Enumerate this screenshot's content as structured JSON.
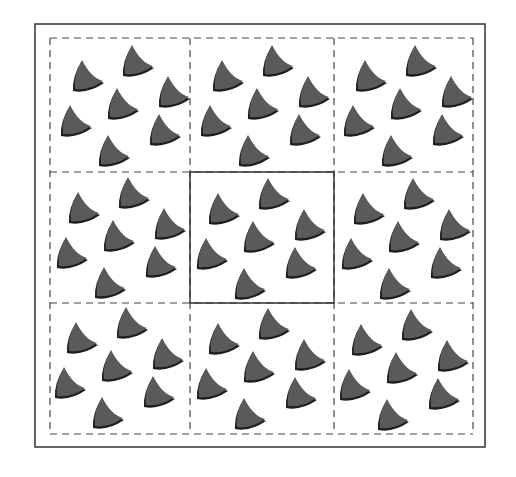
{
  "figure": {
    "colors": {
      "background": "#ffffff",
      "frame": "#333333",
      "dashed": "#444444",
      "motif_fill": "#5a5a5a",
      "motif_shadow": "#1e1e1e"
    },
    "outer_frame": {
      "x": 35,
      "y": 24,
      "w": 450,
      "h": 423
    },
    "grid": {
      "x_lines": [
        50,
        190,
        334,
        473
      ],
      "y_lines": [
        38,
        172,
        303,
        434
      ],
      "center_cell": {
        "row": 1,
        "col": 1,
        "style": "solid"
      },
      "other_cells_style": "dashed"
    },
    "motif": {
      "name": "shark-fin",
      "width": 34,
      "height": 32
    },
    "base_pattern": [
      {
        "x": 20,
        "y": 22
      },
      {
        "x": 70,
        "y": 7
      },
      {
        "x": 106,
        "y": 38
      },
      {
        "x": 55,
        "y": 50
      },
      {
        "x": 8,
        "y": 67
      },
      {
        "x": 97,
        "y": 76
      },
      {
        "x": 46,
        "y": 97
      }
    ],
    "cells": [
      {
        "row": 0,
        "col": 0,
        "dx": 0,
        "dy": 0
      },
      {
        "row": 0,
        "col": 1,
        "dx": 0,
        "dy": 0
      },
      {
        "row": 0,
        "col": 2,
        "dx": -1,
        "dy": 0
      },
      {
        "row": 1,
        "col": 0,
        "dx": -4,
        "dy": -2
      },
      {
        "row": 1,
        "col": 1,
        "dx": -4,
        "dy": -1
      },
      {
        "row": 1,
        "col": 2,
        "dx": -3,
        "dy": -1
      },
      {
        "row": 2,
        "col": 0,
        "dx": -6,
        "dy": -3
      },
      {
        "row": 2,
        "col": 1,
        "dx": -4,
        "dy": -2
      },
      {
        "row": 2,
        "col": 2,
        "dx": -5,
        "dy": -1
      }
    ]
  }
}
